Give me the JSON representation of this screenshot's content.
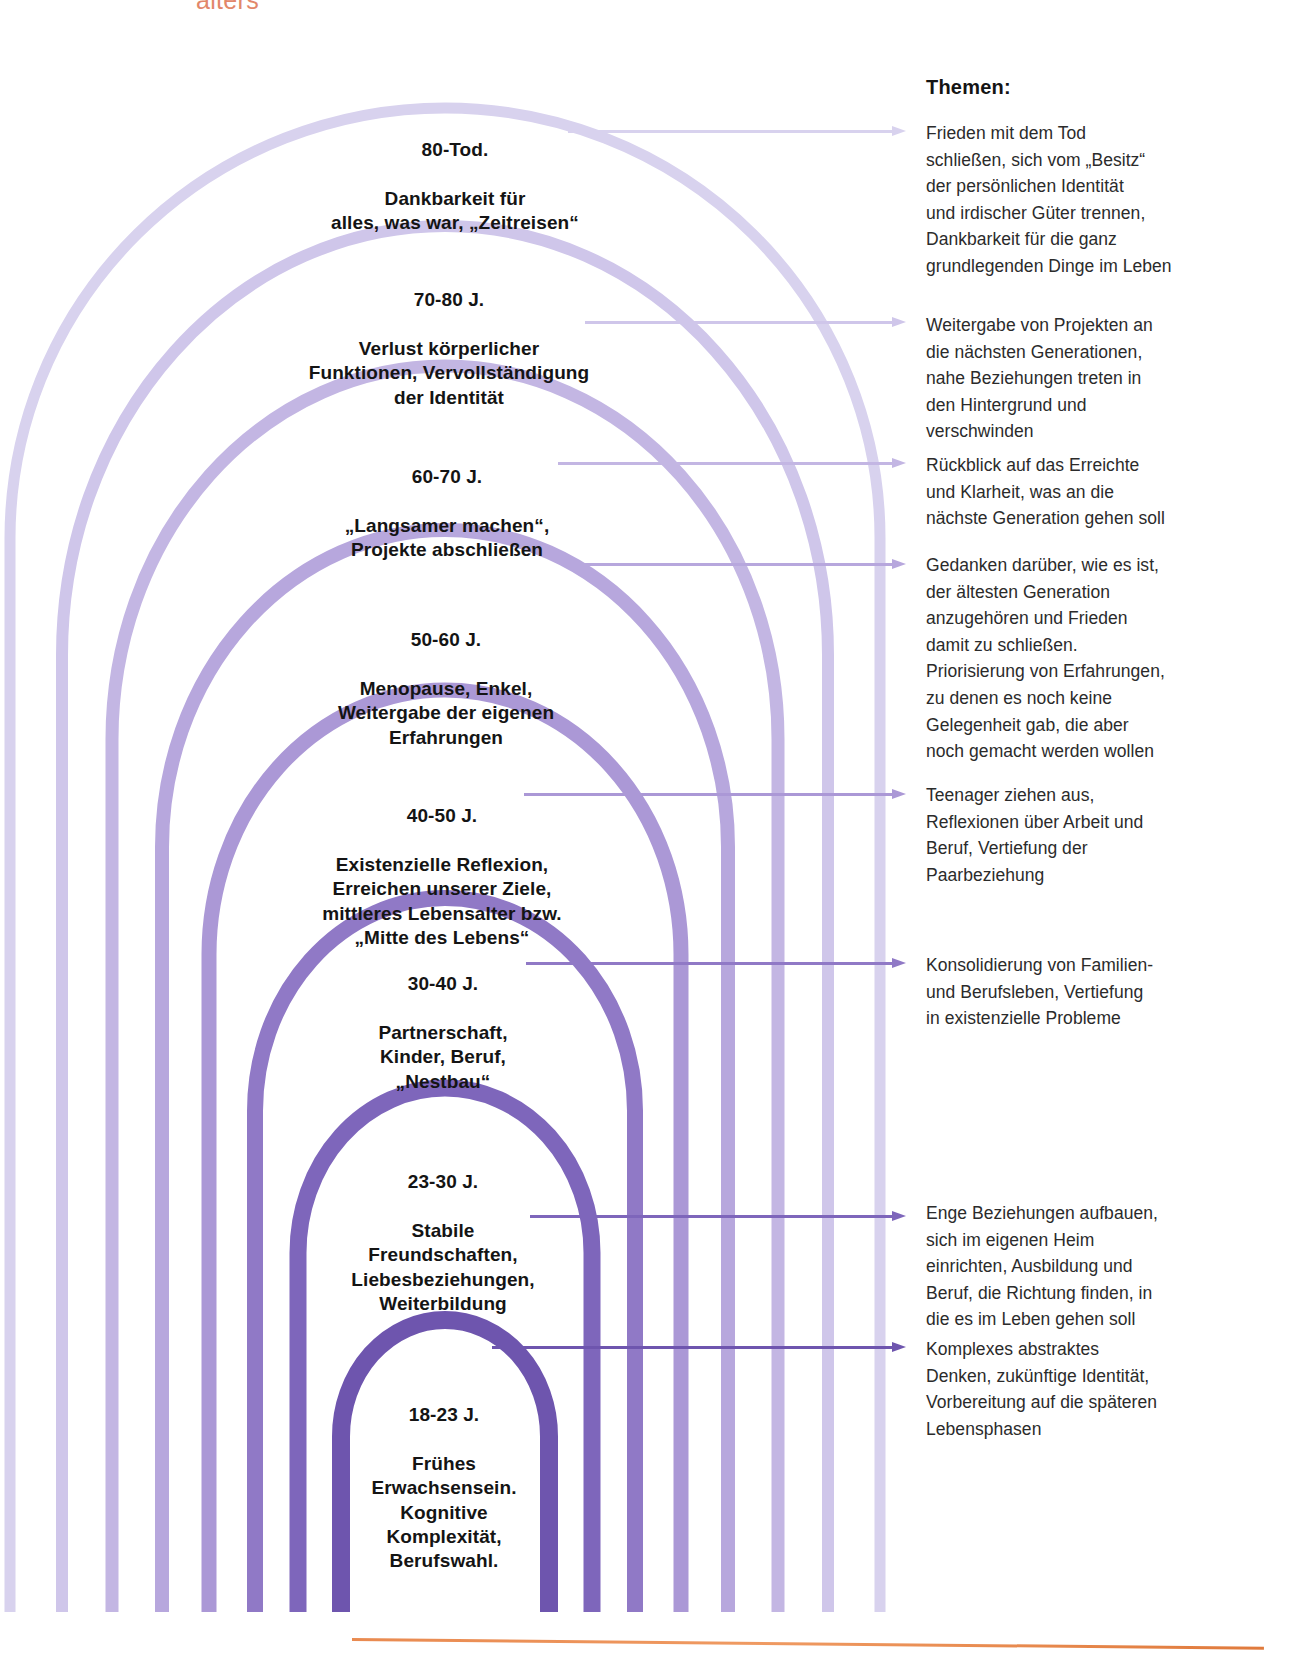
{
  "page": {
    "top_cut_word": "alters",
    "accent_orange": "#e2876a"
  },
  "themen": {
    "title": "Themen:"
  },
  "palette": {
    "arch_colors": [
      "#d8d2ee",
      "#cfc6ea",
      "#c3b6e3",
      "#b7a7dd",
      "#ab98d6",
      "#9f89cf",
      "#9079c6",
      "#7e66bb",
      "#6e55ae"
    ],
    "text_dark": "#141414",
    "body_text": "#2b2b2b"
  },
  "stages": [
    {
      "id": "80-tod",
      "age": "80-Tod.",
      "desc": "Dankbarkeit für\nalles, was war, „Zeitreisen“",
      "theme": "Frieden mit dem Tod\nschließen, sich vom „Besitz“\nder persönlichen Identität\nund irdischer Güter trennen,\nDankbarkeit für die ganz\ngrundlegenden Dinge im Leben",
      "color": "#d8d2ee"
    },
    {
      "id": "70-80",
      "age": "70-80 J.",
      "desc": "Verlust körperlicher\nFunktionen, Vervollständigung\nder Identität",
      "theme": "Weitergabe von Projekten an\ndie nächsten Generationen,\nnahe Beziehungen treten in\nden Hintergrund und\nverschwinden",
      "color": "#cfc6ea"
    },
    {
      "id": "60-70",
      "age": "60-70 J.",
      "desc": "„Langsamer machen“,\nProjekte abschließen",
      "theme": "Rückblick auf das Erreichte\nund Klarheit, was an die\nnächste Generation gehen soll",
      "color": "#c3b6e3"
    },
    {
      "id": "50-60",
      "age": "50-60 J.",
      "desc": "Menopause, Enkel,\nWeitergabe der eigenen\nErfahrungen",
      "theme": "Gedanken darüber, wie es ist,\nder ältesten Generation\nanzugehören und Frieden\ndamit zu schließen.\nPriorisierung von Erfahrungen,\nzu denen es noch keine\nGelegenheit gab, die aber\nnoch gemacht werden wollen",
      "color": "#b7a7dd"
    },
    {
      "id": "40-50",
      "age": "40-50 J.",
      "desc": "Existenzielle Reflexion,\nErreichen unserer Ziele,\nmittleres Lebensalter bzw.\n„Mitte des Lebens“",
      "theme": "Teenager ziehen aus,\nReflexionen über Arbeit und\nBeruf, Vertiefung der\nPaarbeziehung",
      "color": "#ab98d6"
    },
    {
      "id": "30-40",
      "age": "30-40 J.",
      "desc": "Partnerschaft,\nKinder, Beruf,\n„Nestbau“",
      "theme": "Konsolidierung von Familien-\nund Berufsleben, Vertiefung\nin existenzielle Probleme",
      "color": "#9079c6"
    },
    {
      "id": "23-30",
      "age": "23-30 J.",
      "desc": "Stabile\nFreundschaften,\nLiebesbeziehungen,\nWeiterbildung",
      "theme": "Enge Beziehungen aufbauen,\nsich im eigenen Heim\neinrichten, Ausbildung und\nBeruf, die Richtung finden, in\ndie es im Leben gehen soll",
      "color": "#7e66bb"
    },
    {
      "id": "18-23",
      "age": "18-23 J.",
      "desc": "Frühes\nErwachsensein.\nKognitive\nKomplexität,\nBerufswahl.",
      "theme": "Komplexes abstraktes\nDenken, zukünftige Identität,\nVorbereitung auf die späteren\nLebensphasen",
      "color": "#6e55ae"
    }
  ]
}
